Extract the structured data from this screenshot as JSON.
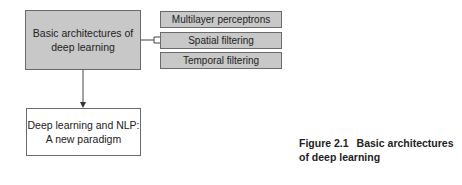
{
  "diagram": {
    "main_node": {
      "label": "Basic architectures of deep learning"
    },
    "sub_nodes": [
      {
        "label": "Multilayer perceptrons"
      },
      {
        "label": "Spatial filtering"
      },
      {
        "label": "Temporal filtering"
      }
    ],
    "next_node": {
      "label_line1": "Deep learning and NLP:",
      "label_line2": "A new paradigm"
    },
    "colors": {
      "main_fill": "#c8c8c8",
      "sub_fill": "#c8c8c8",
      "next_fill": "#ffffff",
      "border": "#6b6b6b"
    }
  },
  "caption": {
    "figure_number": "Figure 2.1",
    "title_line1": "Basic architectures",
    "title_line2": "of deep learning"
  }
}
